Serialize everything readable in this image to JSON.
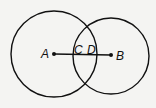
{
  "diagram": {
    "circles": [
      {
        "name": "A",
        "cx": 54,
        "cy": 54,
        "r": 43
      },
      {
        "name": "B",
        "cx": 111,
        "cy": 56,
        "r": 38
      }
    ],
    "points": [
      {
        "label": "A",
        "x": 54,
        "y": 54,
        "lx": 41,
        "ly": 58
      },
      {
        "label": "B",
        "x": 111,
        "y": 55,
        "lx": 116,
        "ly": 60
      }
    ],
    "segment": {
      "from": "A",
      "to": "B"
    },
    "intersection_labels": [
      {
        "label": "C",
        "x": 74,
        "y": 58
      },
      {
        "label": "D",
        "x": 86,
        "y": 58
      }
    ],
    "stroke_color": "#111111"
  }
}
